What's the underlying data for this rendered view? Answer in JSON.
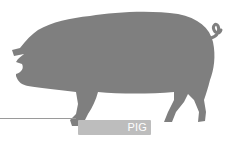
{
  "illustration": {
    "subject": "pig-silhouette",
    "fill_color": "#7f7f7f",
    "background": "#ffffff"
  },
  "label": {
    "text": "PIG",
    "tag_color": "#bdbdbd",
    "text_color": "#ffffff",
    "line_color": "#9a9a9a"
  }
}
